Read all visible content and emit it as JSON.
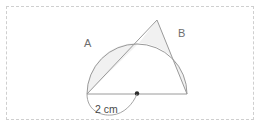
{
  "figure": {
    "labels": {
      "region_a": "A",
      "region_b": "B"
    },
    "dimension": {
      "value": "2",
      "unit": "cm",
      "text": "2 cm"
    },
    "colors": {
      "stroke": "#9a9a9a",
      "shade_fill": "#f1f1f1",
      "label": "#6e6e6e",
      "dimension_text": "#4a4a4a",
      "frame_dash": "#cfcfcf",
      "center_dot": "#2b2b2b",
      "background": "#ffffff"
    },
    "geometry": {
      "center_x": 137,
      "center_y": 94,
      "radius": 50,
      "left_endpoint_x": 87,
      "left_endpoint_y": 94,
      "right_endpoint_x": 187,
      "right_endpoint_y": 94,
      "apex_x": 157,
      "apex_y": 20,
      "crossing_x": 139,
      "crossing_y": 43
    }
  }
}
